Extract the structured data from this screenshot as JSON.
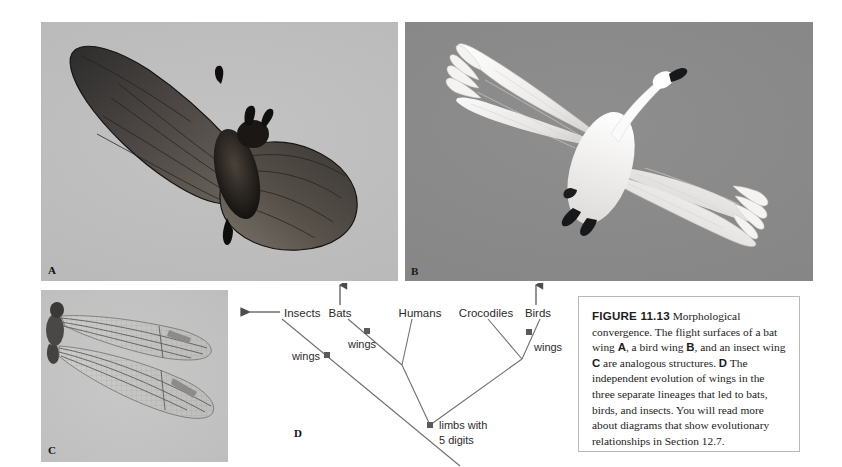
{
  "figure": {
    "number": "FIGURE 11.13",
    "caption_parts": {
      "p1": " Morphological convergence. The flight surfaces of a bat wing ",
      "bold_a": "A",
      "p2": ", a bird wing ",
      "bold_b": "B",
      "p3": ", and an insect wing ",
      "bold_c": "C",
      "p4": " are analogous structures. ",
      "bold_d": "D",
      "p5": " The independent evolution of wings in the three separate lineages that led to bats, birds, and insects. You will read more about diagrams that show evolutionary relationships in Section 12.7."
    },
    "caption_full": "FIGURE 11.13 Morphological convergence. The flight surfaces of a bat wing A, a bird wing B, and an insect wing C are analogous structures. D The independent evolution of wings in the three separate lineages that led to bats, birds, and insects. You will read more about diagrams that show evolutionary relationships in Section 12.7."
  },
  "panels": {
    "a": {
      "letter": "A",
      "subject": "bat-wing-photo"
    },
    "b": {
      "letter": "B",
      "subject": "bird-wing-photo"
    },
    "c": {
      "letter": "C",
      "subject": "insect-wing-photo"
    },
    "d": {
      "letter": "D",
      "subject": "cladogram-diagram"
    }
  },
  "cladogram": {
    "taxa": [
      {
        "id": "insects",
        "label": "Insects"
      },
      {
        "id": "bats",
        "label": "Bats"
      },
      {
        "id": "humans",
        "label": "Humans"
      },
      {
        "id": "crocodiles",
        "label": "Crocodiles"
      },
      {
        "id": "birds",
        "label": "Birds"
      }
    ],
    "trait_nodes": [
      {
        "id": "wings-insects",
        "label": "wings"
      },
      {
        "id": "wings-bats",
        "label": "wings"
      },
      {
        "id": "wings-birds",
        "label": "wings"
      },
      {
        "id": "limbs-root",
        "label_line1": "limbs with",
        "label_line2": "5 digits"
      }
    ],
    "arrows": [
      {
        "id": "arrow-insects",
        "direction": "left",
        "target": "Insects"
      },
      {
        "id": "arrow-bats",
        "direction": "up",
        "target": "Bats"
      },
      {
        "id": "arrow-birds",
        "direction": "up",
        "target": "Birds"
      }
    ],
    "colors": {
      "branch": "#6f6f6f",
      "node": "#5a5a5a",
      "text": "#2b2b2b"
    }
  }
}
